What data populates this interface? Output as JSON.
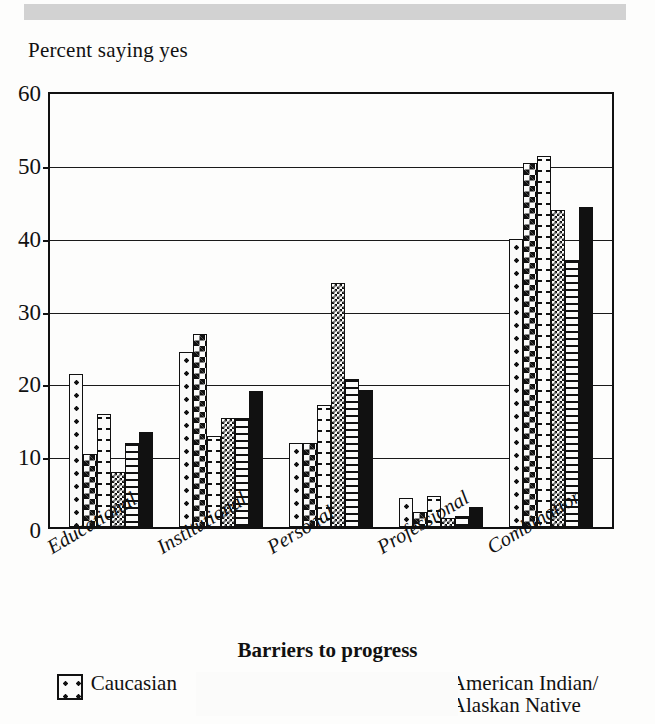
{
  "header": {
    "banner_color": "#d2d2d2"
  },
  "chart_data": {
    "type": "bar",
    "title": "",
    "ylabel": "Percent saying yes",
    "xlabel": "Barriers to progress",
    "ylim": [
      0,
      60
    ],
    "yticks": [
      0,
      10,
      20,
      30,
      40,
      50,
      60
    ],
    "grid": true,
    "legend_position": "bottom",
    "categories": [
      "Educational",
      "Institutional",
      "Personal",
      "Professional",
      "Combination"
    ],
    "series": [
      {
        "name": "Caucasian",
        "pattern": "dots",
        "values": [
          21.0,
          24.0,
          11.5,
          4.0,
          39.5
        ]
      },
      {
        "name": "African-American",
        "pattern": "checker",
        "values": [
          10.0,
          26.5,
          11.5,
          2.0,
          50.0
        ]
      },
      {
        "name": "American Indian/\nAlaskan Native",
        "pattern": "dashes",
        "values": [
          15.5,
          12.5,
          16.7,
          4.3,
          51.0
        ]
      },
      {
        "name": "",
        "pattern": "fine-check",
        "values": [
          7.5,
          15.0,
          33.5,
          1.3,
          43.5
        ]
      },
      {
        "name": "",
        "pattern": "h-lines",
        "values": [
          11.5,
          15.0,
          20.3,
          1.5,
          36.7
        ]
      },
      {
        "name": "",
        "pattern": "solid",
        "values": [
          13.0,
          18.7,
          18.8,
          2.7,
          44.0
        ]
      }
    ]
  },
  "legend": {
    "items": [
      {
        "label": "Caucasian",
        "label2": "",
        "swatch": "dots-swatch"
      },
      {
        "label": "African-American",
        "label2": "",
        "swatch": "checker-swatch"
      },
      {
        "label": "American Indian/",
        "label2": "Alaskan Native",
        "swatch": "dashes-swatch"
      }
    ]
  }
}
